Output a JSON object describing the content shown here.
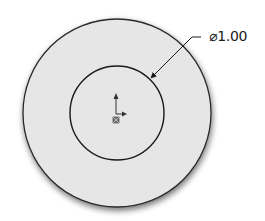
{
  "sketch": {
    "outer_circle": {
      "cx": 117,
      "cy": 113,
      "r": 94,
      "fill": "#e6e6e6",
      "stroke": "#2a2a2a"
    },
    "inner_circle": {
      "cx": 117,
      "cy": 113,
      "r": 47,
      "stroke": "#1a1a1a"
    },
    "origin": {
      "x": 116,
      "y": 113
    }
  },
  "dimension": {
    "label": "⌀1.00",
    "symbol": "diameter-icon",
    "value": "1.00",
    "leader": {
      "from": [
        151,
        78
      ],
      "elbow": [
        192,
        37
      ],
      "to": [
        201,
        37
      ]
    }
  },
  "colors": {
    "background": "#ffffff",
    "face_fill": "#e6e6e6",
    "edge": "#1a1a1a",
    "shadow": "#8a8a8a"
  }
}
